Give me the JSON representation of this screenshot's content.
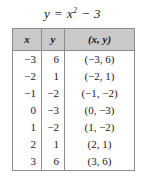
{
  "equation": {
    "lhs": "y",
    "equals": "=",
    "variable": "x",
    "exponent": "2",
    "minus": "−",
    "constant": "3",
    "full_text": "y = x² − 3"
  },
  "table": {
    "headers": [
      "x",
      "y",
      "(x, y)"
    ],
    "rows": [
      {
        "x": "−3",
        "y": "6",
        "pair": "(−3, 6)"
      },
      {
        "x": "−2",
        "y": "1",
        "pair": "(−2, 1)"
      },
      {
        "x": "−1",
        "y": "−2",
        "pair": "(−1, −2)"
      },
      {
        "x": "0",
        "y": "−3",
        "pair": "(0, −3)"
      },
      {
        "x": "1",
        "y": "−2",
        "pair": "(1, −2)"
      },
      {
        "x": "2",
        "y": "1",
        "pair": "(2, 1)"
      },
      {
        "x": "3",
        "y": "6",
        "pair": "(3, 6)"
      }
    ]
  },
  "colors": {
    "header_background": "#c9c9c9",
    "border": "#8d8d8d",
    "text": "#1a1a1a",
    "cell_background": "#ffffff"
  }
}
